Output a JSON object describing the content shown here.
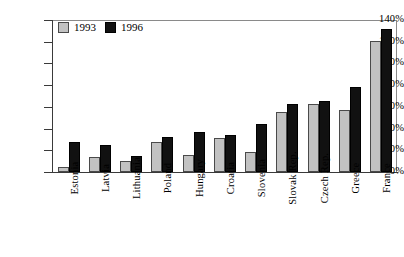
{
  "chart_data": {
    "type": "bar",
    "title": "",
    "subtitle": "",
    "xlabel": "",
    "ylabel": "",
    "ylim": [
      0,
      140
    ],
    "ytick_step": 20,
    "ytick_labels": [
      "140%",
      "120%",
      "100%",
      "80%",
      "60%",
      "40%",
      "20%",
      "0%"
    ],
    "ytick_values": [
      140,
      120,
      100,
      80,
      60,
      40,
      20,
      0
    ],
    "grid": false,
    "legend_position": "top-left",
    "categories": [
      "Estonia",
      "Latvia",
      "Lithuania",
      "Poland",
      "Hungary",
      "Croatia",
      "Slovenia",
      "Slovak Rep.",
      "Czech Rep.",
      "Greece",
      "France"
    ],
    "series": [
      {
        "name": "1993",
        "color": "#c2c2c2",
        "values": [
          5,
          14,
          10,
          28,
          16,
          31,
          18,
          55,
          63,
          57,
          121
        ]
      },
      {
        "name": "1996",
        "color": "#111111",
        "values": [
          28,
          25,
          15,
          32,
          37,
          34,
          44,
          63,
          65,
          78,
          132
        ]
      }
    ]
  },
  "legend": {
    "items": [
      {
        "label": "1993",
        "swatch": "light-grey-square"
      },
      {
        "label": "1996",
        "swatch": "black-square"
      }
    ]
  }
}
